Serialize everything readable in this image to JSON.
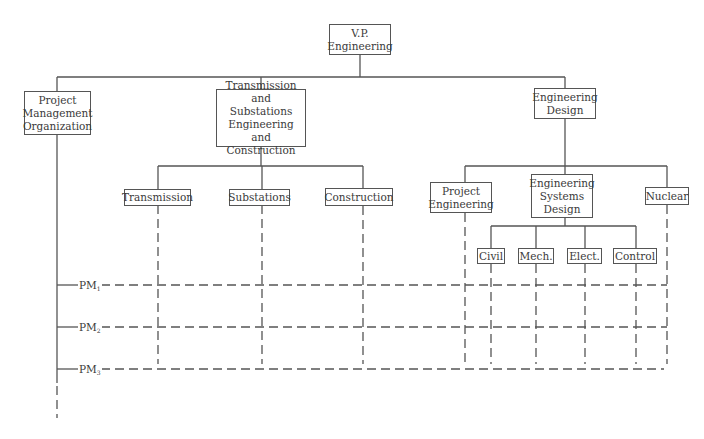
{
  "diagram": {
    "type": "matrix organization chart",
    "root": {
      "label": "V.P.\nEngineering"
    },
    "level1": [
      {
        "label": "Project\nManagement\nOrganization"
      },
      {
        "label": "Transmission and\nSubstations\nEngineering\nand Construction"
      },
      {
        "label": "Engineering\nDesign"
      }
    ],
    "tse_children": [
      {
        "label": "Transmission"
      },
      {
        "label": "Substations"
      },
      {
        "label": "Construction"
      }
    ],
    "ed_children": [
      {
        "label": "Project\nEngineering"
      },
      {
        "label": "Engineering\nSystems\nDesign"
      },
      {
        "label": "Nuclear"
      }
    ],
    "esd_children": [
      {
        "label": "Civil"
      },
      {
        "label": "Mech."
      },
      {
        "label": "Elect."
      },
      {
        "label": "Control"
      }
    ],
    "project_managers": [
      {
        "label": "PM",
        "sub": "1"
      },
      {
        "label": "PM",
        "sub": "2"
      },
      {
        "label": "PM",
        "sub": "3"
      }
    ],
    "colors": {
      "line": "#555555",
      "text": "#3a3a3a",
      "background": "#ffffff"
    }
  }
}
